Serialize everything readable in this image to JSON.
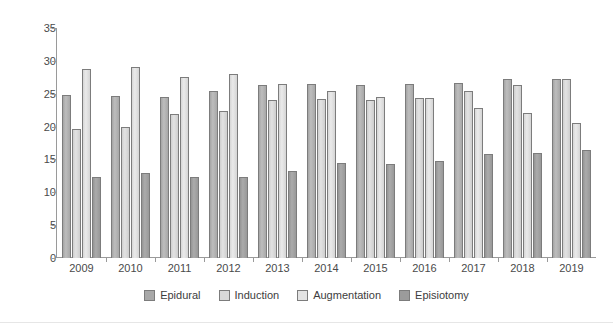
{
  "chart_data": {
    "type": "bar",
    "title": "",
    "subtitle": "",
    "xlabel": "",
    "ylabel": "",
    "grid": false,
    "legend_position": "bottom",
    "ylim": [
      0,
      35
    ],
    "yticks": [
      0,
      5,
      10,
      15,
      20,
      25,
      30,
      35
    ],
    "categories": [
      "2009",
      "2010",
      "2011",
      "2012",
      "2013",
      "2014",
      "2015",
      "2016",
      "2017",
      "2018",
      "2019"
    ],
    "series": [
      {
        "name": "Epidural",
        "color": "#a8a8a8",
        "values": [
          24.8,
          24.6,
          24.5,
          25.4,
          26.4,
          26.5,
          26.4,
          26.5,
          26.6,
          27.3,
          27.2
        ]
      },
      {
        "name": "Induction",
        "color": "#d9d9d9",
        "values": [
          19.6,
          19.9,
          21.9,
          22.3,
          24.0,
          24.2,
          24.0,
          24.3,
          25.4,
          26.4,
          27.3
        ]
      },
      {
        "name": "Augmentation",
        "color": "#e3e3e3",
        "values": [
          28.8,
          29.1,
          27.6,
          28.0,
          26.5,
          25.4,
          24.5,
          24.4,
          22.9,
          22.1,
          20.5
        ]
      },
      {
        "name": "Episiotomy",
        "color": "#9b9b9b",
        "values": [
          12.4,
          12.9,
          12.3,
          12.4,
          13.2,
          14.5,
          14.3,
          14.8,
          15.9,
          16.0,
          16.5
        ]
      }
    ]
  }
}
